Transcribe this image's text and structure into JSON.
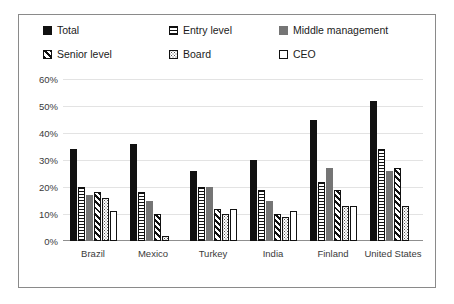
{
  "chart_data": {
    "type": "bar",
    "title": "",
    "xlabel": "",
    "ylabel": "",
    "ylim": [
      0,
      60
    ],
    "ytick_labels": [
      "60%",
      "50%",
      "40%",
      "30%",
      "20%",
      "10%",
      "0%"
    ],
    "ytick_values": [
      60,
      50,
      40,
      30,
      20,
      10,
      0
    ],
    "grid": true,
    "legend_position": "top",
    "categories": [
      "Brazil",
      "Mexico",
      "Turkey",
      "India",
      "Finland",
      "United States"
    ],
    "series": [
      {
        "name": "Total",
        "pattern": "solid-black",
        "values": [
          34,
          36,
          26,
          30,
          45,
          52
        ]
      },
      {
        "name": "Entry level",
        "pattern": "horizontal-lines",
        "values": [
          20,
          18,
          20,
          19,
          22,
          34
        ]
      },
      {
        "name": "Middle management",
        "pattern": "solid-gray",
        "values": [
          17,
          15,
          20,
          15,
          27,
          26
        ]
      },
      {
        "name": "Senior level",
        "pattern": "diagonal-lines",
        "values": [
          18,
          10,
          12,
          10,
          19,
          27
        ]
      },
      {
        "name": "Board",
        "pattern": "dotted",
        "values": [
          16,
          2,
          10,
          9,
          13,
          13
        ]
      },
      {
        "name": "CEO",
        "pattern": "outline-white",
        "values": [
          11,
          0,
          12,
          11,
          13,
          0
        ]
      }
    ]
  },
  "legend": {
    "items": [
      {
        "label": "Total",
        "swatch": "sw-total"
      },
      {
        "label": "Entry level",
        "swatch": "sw-entry"
      },
      {
        "label": "Middle management",
        "swatch": "sw-middle"
      },
      {
        "label": "Senior level",
        "swatch": "sw-senior"
      },
      {
        "label": "Board",
        "swatch": "sw-board"
      },
      {
        "label": "CEO",
        "swatch": "sw-ceo"
      }
    ]
  },
  "colors": {
    "series_black": "#111111",
    "series_gray": "#757575",
    "gridline": "#e3e3e3",
    "frame_border": "#8a8a8a",
    "text": "#3a3a3a",
    "background": "#ffffff"
  }
}
